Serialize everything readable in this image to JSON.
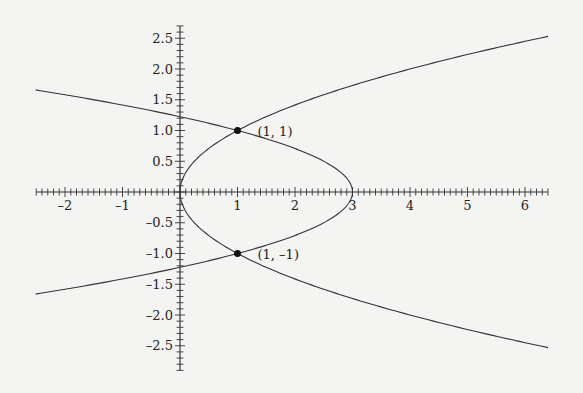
{
  "chart_data": {
    "type": "line",
    "title": "",
    "xlabel": "",
    "ylabel": "",
    "xlim": [
      -2.5,
      6.4
    ],
    "ylim": [
      -2.9,
      2.7
    ],
    "grid": false,
    "x_ticks": [
      "-2",
      "-1",
      "1",
      "2",
      "3",
      "4",
      "5",
      "6"
    ],
    "y_ticks": [
      "2.5",
      "2.0",
      "1.5",
      "1.0",
      "0.5",
      "-0.5",
      "-1.0",
      "-1.5",
      "-2.0",
      "-2.5"
    ],
    "series": [
      {
        "name": "x = y^2",
        "equation": "x = y^2",
        "y_range": [
          -2.53,
          2.53
        ]
      },
      {
        "name": "x = 3 - 2y^2",
        "equation": "x = 3 - 2y^2",
        "y_range": [
          -1.66,
          1.66
        ]
      }
    ],
    "points": [
      {
        "x": 1,
        "y": 1,
        "label": "(1, 1)"
      },
      {
        "x": 1,
        "y": -1,
        "label": "(1, –1)"
      }
    ]
  }
}
